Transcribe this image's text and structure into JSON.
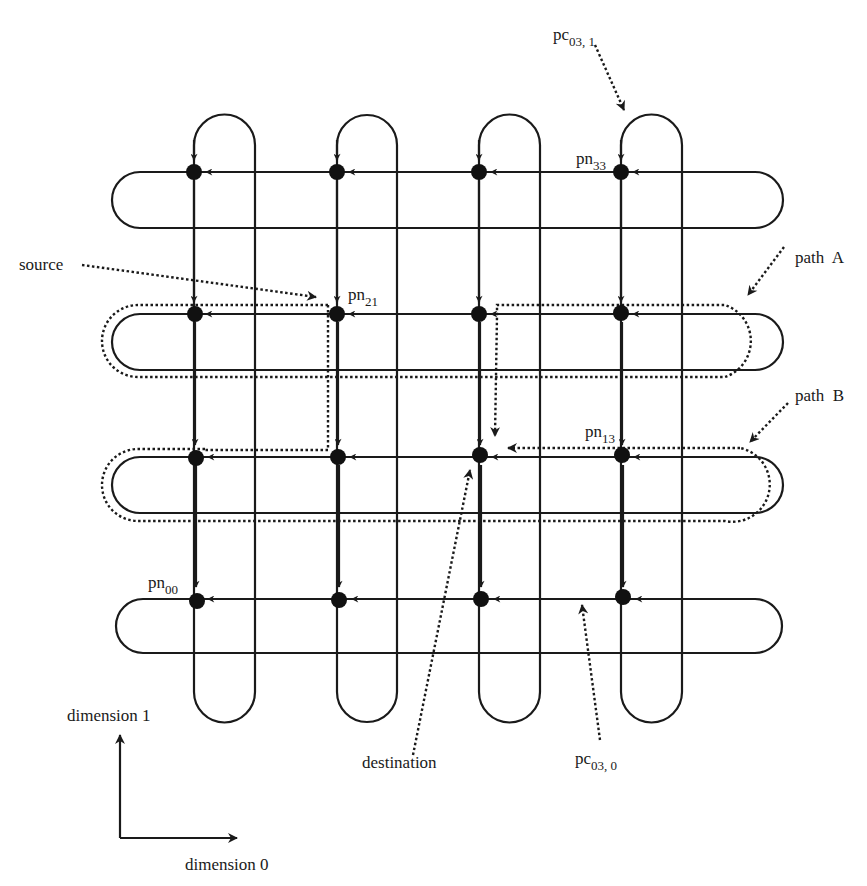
{
  "diagram": {
    "type": "2D torus / mesh routing diagram",
    "colors": {
      "ink": "#1a1a1a",
      "background": "#ffffff"
    },
    "grid": {
      "rows": 4,
      "cols": 4,
      "node_x": [
        194,
        337,
        479,
        621
      ],
      "node_y": [
        172,
        314,
        457,
        599
      ],
      "return_x": [
        255,
        397,
        540,
        682
      ],
      "return_y": [
        228,
        370,
        513,
        653
      ]
    },
    "labels": {
      "pc031": {
        "main": "pc",
        "sub": "03, 1"
      },
      "pn33": {
        "main": "pn",
        "sub": "33"
      },
      "source": "source",
      "pn21": {
        "main": "pn",
        "sub": "21"
      },
      "pathA": "path  A",
      "pathB": "path  B",
      "pn13": {
        "main": "pn",
        "sub": "13"
      },
      "pn00": {
        "main": "pn",
        "sub": "00"
      },
      "destination": "destination",
      "pc030": {
        "main": "pc",
        "sub": "03, 0"
      },
      "dim1": "dimension 1",
      "dim0": "dimension 0"
    },
    "nodes": [
      {
        "id": "pn00",
        "row": 0,
        "col": 0
      },
      {
        "id": "pn01",
        "row": 0,
        "col": 1
      },
      {
        "id": "pn02",
        "row": 0,
        "col": 2
      },
      {
        "id": "pn03",
        "row": 0,
        "col": 3
      },
      {
        "id": "pn10",
        "row": 1,
        "col": 0
      },
      {
        "id": "pn11",
        "row": 1,
        "col": 1
      },
      {
        "id": "pn12",
        "row": 1,
        "col": 2
      },
      {
        "id": "pn13",
        "row": 1,
        "col": 3
      },
      {
        "id": "pn20",
        "row": 2,
        "col": 0
      },
      {
        "id": "pn21",
        "row": 2,
        "col": 1
      },
      {
        "id": "pn22",
        "row": 2,
        "col": 2
      },
      {
        "id": "pn23",
        "row": 2,
        "col": 3
      },
      {
        "id": "pn30",
        "row": 3,
        "col": 0
      },
      {
        "id": "pn31",
        "row": 3,
        "col": 1
      },
      {
        "id": "pn32",
        "row": 3,
        "col": 2
      },
      {
        "id": "pn33",
        "row": 3,
        "col": 3
      }
    ]
  }
}
